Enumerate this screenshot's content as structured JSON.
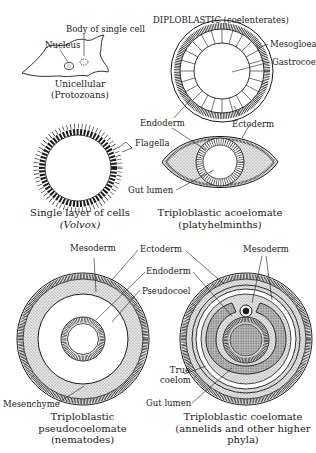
{
  "figure": {
    "panels": {
      "unicellular": {
        "labels": {
          "body": "Body of single cell",
          "nucleus": "Nucleus"
        },
        "caption": [
          "Unicellular",
          "(Protozoans)"
        ]
      },
      "diploblastic": {
        "title": "DIPLOBLASTIC (coelenterates)",
        "labels": {
          "mesogloea": "Mesogloea",
          "gastrocoel": "Gastrocoel",
          "endoderm": "Endoderm",
          "ectoderm": "Ectoderm"
        }
      },
      "volvox": {
        "labels": {
          "flagella": "Flagella"
        },
        "caption": [
          "Single layer of cells",
          "(Volvox)"
        ]
      },
      "acoelomate": {
        "labels": {
          "gut_lumen": "Gut lumen"
        },
        "caption": [
          "Triploblastic acoelomate",
          "(platyhelminths)"
        ]
      },
      "pseudocoelomate": {
        "labels": {
          "mesoderm": "Mesoderm",
          "ectoderm": "Ectoderm",
          "endoderm": "Endoderm",
          "pseudocoel": "Pseudocoel",
          "mesenchyme": "Mesenchyme"
        },
        "caption": [
          "Triploblastic",
          "pseudocoelomate",
          "(nematodes)"
        ]
      },
      "coelomate": {
        "labels": {
          "mesoderm": "Mesoderm",
          "true_coelom": [
            "True",
            "coelom"
          ],
          "gut_lumen": "Gut lumen"
        },
        "caption": [
          "Triploblastic coelomate",
          "(annelids and other higher",
          "phyla)"
        ]
      }
    },
    "colors": {
      "ink": "#1a1a1a",
      "stipple": "#c8c8c8",
      "background": "#ffffff"
    }
  }
}
